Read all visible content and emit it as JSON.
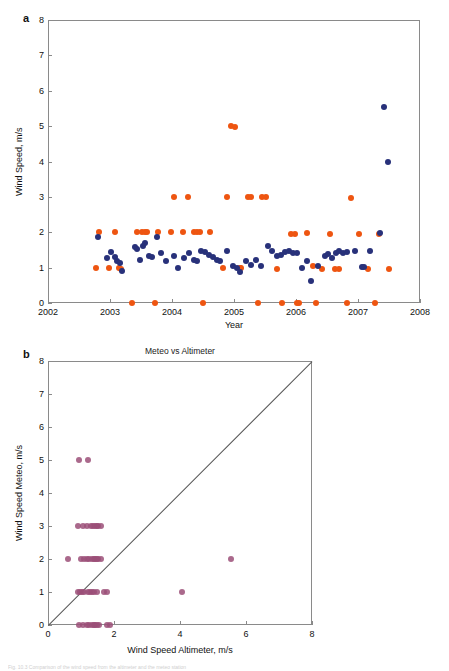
{
  "figure": {
    "caption": "Fig. 10.3 Comparison of the wind speed from the altimeter and the meteo station"
  },
  "colors": {
    "altimeter": "#EE5511",
    "meteo": "#28317A",
    "combined": "#9B4F78",
    "axis": "#8A8A8A",
    "identity_line": "#555555"
  },
  "chart_data": [
    {
      "panel": "a",
      "type": "scatter",
      "title": "",
      "xlabel": "Year",
      "ylabel": "Wind Speed, m/s",
      "xlim": [
        2002,
        2008
      ],
      "ylim": [
        0,
        8
      ],
      "xticks": [
        2002,
        2003,
        2004,
        2005,
        2006,
        2007,
        2008
      ],
      "yticks": [
        0,
        1,
        2,
        3,
        4,
        5,
        6,
        7,
        8
      ],
      "grid": false,
      "legend": "none",
      "series": [
        {
          "name": "Altimeter",
          "color": "#EE5511",
          "points": [
            [
              2002.78,
              1.0
            ],
            [
              2002.83,
              2.0
            ],
            [
              2002.99,
              1.0
            ],
            [
              2003.08,
              2.0
            ],
            [
              2003.14,
              1.0
            ],
            [
              2003.17,
              0.95
            ],
            [
              2003.35,
              0.0
            ],
            [
              2003.43,
              2.0
            ],
            [
              2003.52,
              2.0
            ],
            [
              2003.56,
              2.0
            ],
            [
              2003.6,
              2.0
            ],
            [
              2003.72,
              0.0
            ],
            [
              2003.78,
              2.0
            ],
            [
              2003.99,
              2.0
            ],
            [
              2004.04,
              3.0
            ],
            [
              2004.18,
              2.0
            ],
            [
              2004.26,
              3.0
            ],
            [
              2004.35,
              2.0
            ],
            [
              2004.4,
              2.0
            ],
            [
              2004.45,
              2.0
            ],
            [
              2004.5,
              0.0
            ],
            [
              2004.62,
              2.0
            ],
            [
              2004.82,
              1.0
            ],
            [
              2004.88,
              3.0
            ],
            [
              2004.95,
              5.0
            ],
            [
              2005.01,
              4.98
            ],
            [
              2005.1,
              1.0
            ],
            [
              2005.12,
              1.0
            ],
            [
              2005.22,
              3.0
            ],
            [
              2005.28,
              3.0
            ],
            [
              2005.39,
              0.0
            ],
            [
              2005.45,
              3.0
            ],
            [
              2005.52,
              3.0
            ],
            [
              2005.7,
              0.97
            ],
            [
              2005.78,
              0.0
            ],
            [
              2005.92,
              1.95
            ],
            [
              2005.99,
              1.95
            ],
            [
              2006.01,
              0.0
            ],
            [
              2006.05,
              0.0
            ],
            [
              2006.18,
              1.97
            ],
            [
              2006.27,
              1.05
            ],
            [
              2006.33,
              0.0
            ],
            [
              2006.42,
              0.97
            ],
            [
              2006.55,
              1.95
            ],
            [
              2006.63,
              0.97
            ],
            [
              2006.7,
              0.97
            ],
            [
              2006.82,
              0.0
            ],
            [
              2006.88,
              2.96
            ],
            [
              2007.02,
              1.95
            ],
            [
              2007.16,
              0.97
            ],
            [
              2007.28,
              0.0
            ],
            [
              2007.34,
              1.95
            ],
            [
              2007.5,
              0.96
            ]
          ]
        },
        {
          "name": "Meteo",
          "color": "#28317A",
          "points": [
            [
              2002.8,
              1.87
            ],
            [
              2002.95,
              1.27
            ],
            [
              2003.02,
              1.45
            ],
            [
              2003.08,
              1.3
            ],
            [
              2003.12,
              1.2
            ],
            [
              2003.16,
              1.12
            ],
            [
              2003.19,
              0.9
            ],
            [
              2003.4,
              1.57
            ],
            [
              2003.43,
              1.52
            ],
            [
              2003.48,
              1.22
            ],
            [
              2003.53,
              1.62
            ],
            [
              2003.57,
              1.7
            ],
            [
              2003.63,
              1.33
            ],
            [
              2003.68,
              1.3
            ],
            [
              2003.75,
              1.87
            ],
            [
              2003.82,
              1.42
            ],
            [
              2003.9,
              1.18
            ],
            [
              2004.03,
              1.32
            ],
            [
              2004.1,
              0.98
            ],
            [
              2004.2,
              1.27
            ],
            [
              2004.28,
              1.4
            ],
            [
              2004.35,
              1.22
            ],
            [
              2004.4,
              1.18
            ],
            [
              2004.47,
              1.48
            ],
            [
              2004.53,
              1.43
            ],
            [
              2004.6,
              1.36
            ],
            [
              2004.66,
              1.3
            ],
            [
              2004.72,
              1.22
            ],
            [
              2004.78,
              1.2
            ],
            [
              2004.88,
              1.47
            ],
            [
              2004.98,
              1.05
            ],
            [
              2005.05,
              0.98
            ],
            [
              2005.1,
              0.87
            ],
            [
              2005.2,
              1.2
            ],
            [
              2005.28,
              1.08
            ],
            [
              2005.36,
              1.22
            ],
            [
              2005.43,
              1.05
            ],
            [
              2005.55,
              1.62
            ],
            [
              2005.62,
              1.46
            ],
            [
              2005.7,
              1.33
            ],
            [
              2005.76,
              1.37
            ],
            [
              2005.82,
              1.43
            ],
            [
              2005.88,
              1.47
            ],
            [
              2005.95,
              1.4
            ],
            [
              2006.02,
              1.4
            ],
            [
              2006.1,
              1.0
            ],
            [
              2006.18,
              1.18
            ],
            [
              2006.24,
              0.62
            ],
            [
              2006.36,
              1.05
            ],
            [
              2006.46,
              1.32
            ],
            [
              2006.52,
              1.38
            ],
            [
              2006.58,
              1.28
            ],
            [
              2006.64,
              1.42
            ],
            [
              2006.7,
              1.47
            ],
            [
              2006.76,
              1.4
            ],
            [
              2006.82,
              1.43
            ],
            [
              2006.95,
              1.46
            ],
            [
              2007.06,
              1.02
            ],
            [
              2007.1,
              1.02
            ],
            [
              2007.2,
              1.47
            ],
            [
              2007.36,
              1.97
            ],
            [
              2007.42,
              5.53
            ],
            [
              2007.49,
              4.0
            ]
          ]
        }
      ]
    },
    {
      "panel": "b",
      "type": "scatter",
      "title": "Meteo vs Altimeter",
      "xlabel": "Wind Speed Altimeter, m/s",
      "ylabel": "Wind Speed Meteo, m/s",
      "xlim": [
        0,
        8
      ],
      "ylim": [
        0,
        8
      ],
      "xticks": [
        0,
        2,
        4,
        6,
        8
      ],
      "yticks": [
        0,
        1,
        2,
        3,
        4,
        5,
        6,
        7,
        8
      ],
      "grid": false,
      "legend": "none",
      "identity_line": {
        "from": [
          0,
          0
        ],
        "to": [
          8,
          8
        ]
      },
      "series": [
        {
          "name": "Meteo vs Altimeter",
          "color": "#9B4F78",
          "points": [
            [
              0.95,
              5.0
            ],
            [
              1.2,
              5.0
            ],
            [
              0.9,
              3.0
            ],
            [
              1.05,
              3.0
            ],
            [
              1.18,
              3.0
            ],
            [
              1.3,
              3.0
            ],
            [
              1.37,
              3.0
            ],
            [
              1.42,
              3.0
            ],
            [
              1.47,
              3.0
            ],
            [
              1.52,
              3.0
            ],
            [
              1.6,
              3.0
            ],
            [
              0.62,
              2.0
            ],
            [
              1.0,
              2.0
            ],
            [
              1.08,
              2.0
            ],
            [
              1.18,
              2.0
            ],
            [
              1.25,
              2.0
            ],
            [
              1.32,
              2.0
            ],
            [
              1.38,
              2.0
            ],
            [
              1.43,
              2.0
            ],
            [
              1.47,
              2.0
            ],
            [
              1.52,
              2.0
            ],
            [
              1.6,
              2.0
            ],
            [
              5.55,
              2.0
            ],
            [
              0.9,
              1.0
            ],
            [
              0.97,
              1.0
            ],
            [
              1.02,
              1.0
            ],
            [
              1.1,
              1.0
            ],
            [
              1.22,
              1.0
            ],
            [
              1.28,
              1.0
            ],
            [
              1.33,
              1.0
            ],
            [
              1.4,
              1.0
            ],
            [
              1.47,
              1.0
            ],
            [
              1.7,
              1.0
            ],
            [
              1.8,
              1.0
            ],
            [
              4.05,
              1.0
            ],
            [
              0.95,
              0.0
            ],
            [
              1.05,
              0.0
            ],
            [
              1.18,
              0.0
            ],
            [
              1.25,
              0.0
            ],
            [
              1.32,
              0.0
            ],
            [
              1.38,
              0.0
            ],
            [
              1.43,
              0.0
            ],
            [
              1.48,
              0.0
            ],
            [
              1.55,
              0.0
            ],
            [
              1.8,
              0.0
            ],
            [
              1.88,
              0.0
            ]
          ]
        }
      ]
    }
  ],
  "panel_a": {
    "letter": "a",
    "ylabel": "Wind Speed, m/s",
    "xlabel": "Year",
    "yticks": [
      "8",
      "7",
      "6",
      "5",
      "4",
      "3",
      "2",
      "1",
      "0"
    ],
    "xticks": [
      "2002",
      "2003",
      "2004",
      "2005",
      "2006",
      "2007",
      "2008"
    ]
  },
  "panel_b": {
    "letter": "b",
    "title": "Meteo vs Altimeter",
    "ylabel": "Wind Speed Meteo, m/s",
    "xlabel": "Wind Speed Altimeter, m/s",
    "yticks": [
      "8",
      "7",
      "6",
      "5",
      "4",
      "3",
      "2",
      "1",
      "0"
    ],
    "xticks": [
      "0",
      "2",
      "4",
      "6",
      "8"
    ]
  }
}
